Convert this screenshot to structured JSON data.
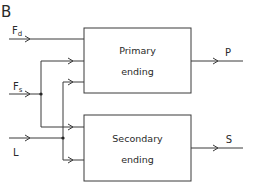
{
  "panel_label": "B",
  "inputs": {
    "fd": {
      "main": "F",
      "sub": "d"
    },
    "fs": {
      "main": "F",
      "sub": "s"
    },
    "l": {
      "main": "L"
    }
  },
  "blocks": {
    "primary": {
      "line1": "Primary",
      "line2": "ending"
    },
    "secondary": {
      "line1": "Secondary",
      "line2": "ending"
    }
  },
  "outputs": {
    "p": "P",
    "s": "S"
  },
  "colors": {
    "line": "#3a3a3a",
    "text": "#2a2a2a",
    "background": "#ffffff"
  }
}
